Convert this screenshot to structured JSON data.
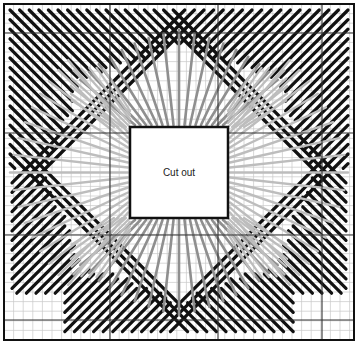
{
  "diagram": {
    "type": "needlepoint-stitch-chart",
    "cutout_label": "Cut out",
    "colors": {
      "background": "#ffffff",
      "grid_minor": "#c8c8c8",
      "grid_major": "#333333",
      "border": "#111111",
      "stitch_dark": "#111111",
      "stitch_mid": "#8f8f8f",
      "stitch_light": "#bdbdbd"
    },
    "grid": {
      "left": 4,
      "top": 4,
      "right": 354,
      "bottom": 340,
      "cell": 9.6,
      "major_x": [
        110,
        218,
        322
      ],
      "major_y": [
        33,
        133,
        235,
        320
      ]
    },
    "cutout": {
      "x": 130,
      "y": 127,
      "w": 98,
      "h": 91
    },
    "regions": [
      {
        "name": "outer-diagonal-band",
        "color": "dark",
        "description": "Diagonal satin stitches radiating from corners"
      },
      {
        "name": "middle-fan",
        "color": "mid",
        "description": "Long fanned stitches converging on cutout edges (top/bottom)"
      },
      {
        "name": "inner-fan",
        "color": "light",
        "description": "Long fanned stitches converging on cutout edges (left/right and diagonals)"
      }
    ]
  }
}
